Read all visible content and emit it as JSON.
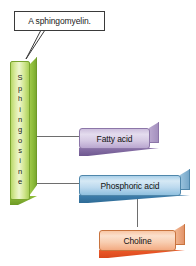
{
  "figure": {
    "background_color": "#ffffff"
  },
  "callout": {
    "text": "A sphingomyelin.",
    "border_color": "#3a3a3a",
    "fill_color": "#ffffff"
  },
  "backbone": {
    "name": "Sphingosine",
    "letters": [
      "S",
      "p",
      "h",
      "i",
      "n",
      "g",
      "o",
      "s",
      "i",
      "n",
      "e"
    ],
    "face_color": "#d9ea9d",
    "edge_color": "#7ba52f",
    "orientation": "vertical"
  },
  "components": [
    {
      "id": "fatty-acid",
      "label": "Fatty acid",
      "color": "#cdbfdd",
      "accent_color": "#6e5890"
    },
    {
      "id": "phosphoric-acid",
      "label": "Phosphoric acid",
      "color": "#a9cfe8",
      "accent_color": "#2e6b96"
    },
    {
      "id": "choline",
      "label": "Choline",
      "color": "#f8c7a6",
      "accent_color": "#d9481c"
    }
  ],
  "connectors": {
    "line_color": "#6e6e6e",
    "links": [
      {
        "from": "Sphingosine",
        "to": "Fatty acid"
      },
      {
        "from": "Sphingosine",
        "to": "Phosphoric acid"
      },
      {
        "from": "Phosphoric acid",
        "to": "Choline"
      }
    ]
  }
}
